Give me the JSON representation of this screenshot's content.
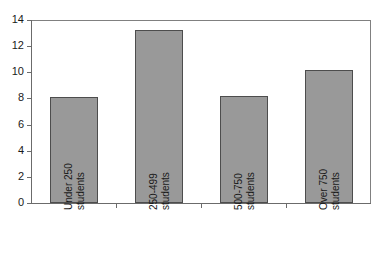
{
  "chart_data": {
    "type": "bar",
    "title": "",
    "subtitle": "",
    "xlabel": "",
    "ylabel": "",
    "categories": [
      "Under 250 students",
      "250-499 students",
      "500-750 students",
      "Over 750 students"
    ],
    "category_lines": [
      [
        "Under 250",
        "students"
      ],
      [
        "250-499",
        "students"
      ],
      [
        "500-750",
        "students"
      ],
      [
        "Over 750",
        "students"
      ]
    ],
    "values": [
      8.1,
      13.2,
      8.2,
      10.2
    ],
    "ylim": [
      0,
      14
    ],
    "ytick_values": [
      0,
      2,
      4,
      6,
      8,
      10,
      12,
      14
    ],
    "ytick_labels": [
      "0",
      "2",
      "4",
      "6",
      "8",
      "10",
      "12",
      "14"
    ],
    "grid": false,
    "legend": false,
    "legend_position": "none",
    "bar_fill_color": "#999999",
    "bar_border_color": "#4d4d4d",
    "axis_color": "#6b6b6b",
    "plot_background": "#ffffff"
  }
}
